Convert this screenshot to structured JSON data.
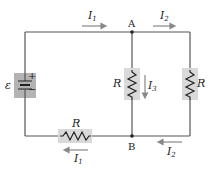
{
  "diagram": {
    "emf_symbol": "ε",
    "battery": {
      "plus": "+",
      "minus": "−"
    },
    "nodes": [
      {
        "label": "A"
      },
      {
        "label": "B"
      }
    ],
    "resistors": [
      {
        "id": "R_bottom",
        "label": "R"
      },
      {
        "id": "R_middle",
        "label": "R"
      },
      {
        "id": "R_right",
        "label": "R"
      }
    ],
    "currents": [
      {
        "id": "I1_top",
        "label": "I",
        "sub": "1",
        "direction": "right"
      },
      {
        "id": "I2_top",
        "label": "I",
        "sub": "2",
        "direction": "right"
      },
      {
        "id": "I3",
        "label": "I",
        "sub": "3",
        "direction": "down"
      },
      {
        "id": "I1_bottom",
        "label": "I",
        "sub": "1",
        "direction": "left"
      },
      {
        "id": "I2_bottom",
        "label": "I",
        "sub": "2",
        "direction": "left"
      }
    ],
    "colors": {
      "wire": "#555555",
      "resistor_bg": "#d9d9d9",
      "battery_bg": "#b3b3b3",
      "arrow": "#888888"
    }
  }
}
